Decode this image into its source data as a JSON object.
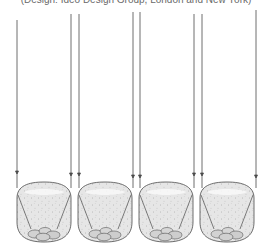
{
  "caption": {
    "text": "(Design: Ideo Design Group, London and New York)"
  },
  "figure": {
    "colors": {
      "line": "#4a4a4a",
      "vessel_fill": "#e4e4e4",
      "vessel_highlight": "#f6f6f6",
      "speckle": "#9a9a9a",
      "pebble_fill": "#cfcfcf"
    },
    "vessels": [
      {
        "id": "vessel-1",
        "x": 16,
        "string_left_x": 17,
        "string_right_x": 71
      },
      {
        "id": "vessel-2",
        "x": 77,
        "string_left_x": 79,
        "string_right_x": 133
      },
      {
        "id": "vessel-3",
        "x": 138,
        "string_left_x": 140,
        "string_right_x": 194
      },
      {
        "id": "vessel-4",
        "x": 199,
        "string_left_x": 202,
        "string_right_x": 256
      }
    ]
  }
}
